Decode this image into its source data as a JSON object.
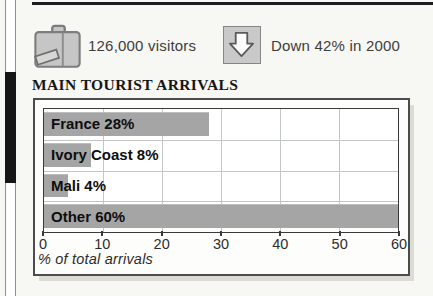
{
  "header": {
    "visitors": {
      "icon": "suitcase-icon",
      "label": "126,000 visitors"
    },
    "trend": {
      "icon": "down-arrow-icon",
      "label": "Down 42% in 2000"
    }
  },
  "section": {
    "title": "MAIN TOURIST ARRIVALS"
  },
  "chart_data": {
    "type": "bar",
    "orientation": "horizontal",
    "title": "MAIN TOURIST ARRIVALS",
    "categories": [
      "France",
      "Ivory Coast",
      "Mali",
      "Other"
    ],
    "values": [
      28,
      8,
      4,
      60
    ],
    "bar_labels": [
      "France 28%",
      "Ivory Coast 8%",
      "Mali 4%",
      "Other 60%"
    ],
    "x_ticks": [
      0,
      10,
      20,
      30,
      40,
      50,
      60
    ],
    "xlim": [
      0,
      60
    ],
    "xlabel": "% of total arrivals",
    "grid": true,
    "legend": false,
    "bar_color": "#a5a5a5",
    "gridline_color": "#c3c7c3"
  },
  "colors": {
    "page_background": "#f7f7f3",
    "top_rule": "#1e1e1e",
    "icon_fill": "#c6c6c6",
    "icon_border": "#7d7d7d",
    "spine_marker": "#161616"
  }
}
